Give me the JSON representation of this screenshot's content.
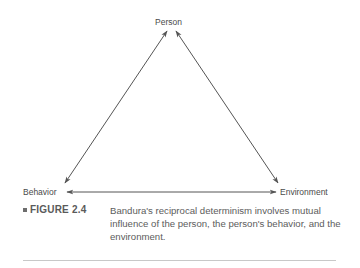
{
  "diagram": {
    "type": "triangle-reciprocal",
    "nodes": {
      "top": "Person",
      "left": "Behavior",
      "right": "Environment"
    },
    "edges": [
      {
        "from": "Person",
        "to": "Behavior",
        "direction": "bidirectional"
      },
      {
        "from": "Person",
        "to": "Environment",
        "direction": "bidirectional"
      },
      {
        "from": "Behavior",
        "to": "Environment",
        "direction": "bidirectional"
      }
    ],
    "line_color": "#555555"
  },
  "caption": {
    "figure_label": "FIGURE 2.4",
    "text": "Bandura's reciprocal determinism involves mutual influence of the person, the person's behavior, and the environment."
  }
}
